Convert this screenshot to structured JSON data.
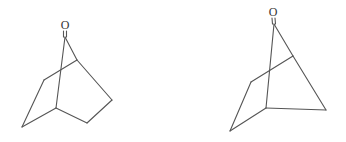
{
  "diagram": {
    "type": "chemical-structures",
    "colors": {
      "background": "#ffffff",
      "bond": "#555555",
      "label": "#333333"
    },
    "molecules": [
      {
        "name": "bicyclic-ketone-left",
        "atoms": [
          {
            "label": "O",
            "x": 65,
            "y": 29
          }
        ]
      },
      {
        "name": "bicyclic-ketone-right",
        "atoms": [
          {
            "label": "O",
            "x": 273,
            "y": 16
          }
        ]
      }
    ]
  }
}
